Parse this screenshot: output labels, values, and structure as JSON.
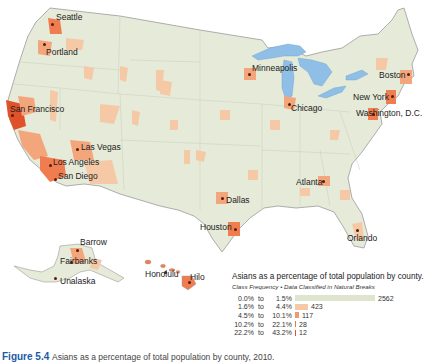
{
  "colors": {
    "land": "#e6ead8",
    "state_border": "#c9cdbb",
    "coast": "#9a9a9a",
    "water": "#8fbfe6",
    "class1": "#e2e6d2",
    "class2": "#f6c9a6",
    "class3": "#f3a57c",
    "class4": "#ef7d4f",
    "class5": "#e0522a",
    "dot": "#5a1a0a",
    "caption": "#1b5aa6"
  },
  "cities": [
    {
      "name": "Seattle",
      "x": 52,
      "y": 24,
      "lx": 56,
      "ly": 13
    },
    {
      "name": "Portland",
      "x": 44,
      "y": 44,
      "lx": 46,
      "ly": 48
    },
    {
      "name": "San Francisco",
      "x": 12,
      "y": 115,
      "lx": 10,
      "ly": 105
    },
    {
      "name": "Las Vegas",
      "x": 77,
      "y": 149,
      "lx": 81,
      "ly": 143
    },
    {
      "name": "Los Angeles",
      "x": 50,
      "y": 165,
      "lx": 53,
      "ly": 158
    },
    {
      "name": "San Diego",
      "x": 55,
      "y": 179,
      "lx": 58,
      "ly": 172
    },
    {
      "name": "Minneapolis",
      "x": 249,
      "y": 74,
      "lx": 252,
      "ly": 64
    },
    {
      "name": "Chicago",
      "x": 289,
      "y": 104,
      "lx": 291,
      "ly": 104
    },
    {
      "name": "Boston",
      "x": 408,
      "y": 74,
      "lx": 379,
      "ly": 71
    },
    {
      "name": "New York",
      "x": 392,
      "y": 96,
      "lx": 353,
      "ly": 93
    },
    {
      "name": "Washington, D.C.",
      "x": 373,
      "y": 114,
      "lx": 356,
      "ly": 109
    },
    {
      "name": "Atlanta",
      "x": 323,
      "y": 181,
      "lx": 296,
      "ly": 178
    },
    {
      "name": "Dallas",
      "x": 222,
      "y": 198,
      "lx": 226,
      "ly": 196
    },
    {
      "name": "Houston",
      "x": 235,
      "y": 229,
      "lx": 200,
      "ly": 223
    },
    {
      "name": "Orlando",
      "x": 357,
      "y": 230,
      "lx": 347,
      "ly": 234
    },
    {
      "name": "Barrow",
      "x": 77,
      "y": 250,
      "lx": 80,
      "ly": 238
    },
    {
      "name": "Fairbanks",
      "x": 71,
      "y": 262,
      "lx": 60,
      "ly": 257
    },
    {
      "name": "Unalaska",
      "x": 55,
      "y": 278,
      "lx": 60,
      "ly": 277
    },
    {
      "name": "Honolulu",
      "x": 165,
      "y": 272,
      "lx": 145,
      "ly": 270
    },
    {
      "name": "Hilo",
      "x": 189,
      "y": 282,
      "lx": 190,
      "ly": 273
    }
  ],
  "legend": {
    "title": "Asians as a percentage of total population by county.",
    "subtitle": "Class Frequency • Data Classified in Natural Breaks",
    "to_word": "to",
    "classes": [
      {
        "from": "0.0%",
        "to": "1.5%",
        "count": "2562",
        "bar_width": 80,
        "color": "#dfe4cf"
      },
      {
        "from": "1.6%",
        "to": "4.4%",
        "count": "423",
        "bar_width": 13,
        "color": "#f6c9a6"
      },
      {
        "from": "4.5%",
        "to": "10.1%",
        "count": "117",
        "bar_width": 4,
        "color": "#ef9a6c"
      },
      {
        "from": "10.2%",
        "to": "22.1%",
        "count": "28",
        "bar_width": 1,
        "color": "#e8764a"
      },
      {
        "from": "22.2%",
        "to": "43.2%",
        "count": "12",
        "bar_width": 1,
        "color": "#e0522a"
      }
    ]
  },
  "caption": {
    "label": "Figure 5.4",
    "text": "Asians as a percentage of total population by county, 2010."
  }
}
